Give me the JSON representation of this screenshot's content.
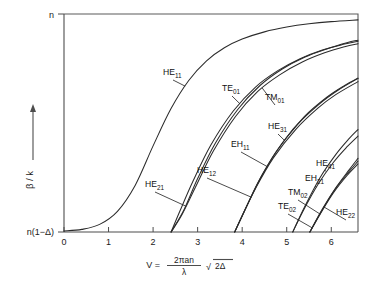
{
  "chart_data": {
    "type": "line",
    "title": "",
    "xlabel": "V = 2πan/λ √(2Δ)",
    "ylabel": "β / k",
    "xlim": [
      0,
      6.6
    ],
    "ylim": [
      0,
      1
    ],
    "grid": false,
    "legend_position": "inline-annotations",
    "x_ticks": [
      "0",
      "1",
      "2",
      "3",
      "4",
      "5",
      "6"
    ],
    "x_tick_values": [
      0,
      1,
      2,
      3,
      4,
      5,
      6
    ],
    "y_tick_labels": [
      "n",
      "n(1-Δ)"
    ],
    "y_tick_values": [
      1,
      0
    ],
    "series": [
      {
        "name": "HE11",
        "label_base": "HE",
        "label_sub": "11",
        "cutoff_v": 0.0,
        "points": [
          [
            0,
            0.005
          ],
          [
            0.4,
            0.012
          ],
          [
            0.8,
            0.035
          ],
          [
            1.2,
            0.095
          ],
          [
            1.6,
            0.215
          ],
          [
            2.0,
            0.395
          ],
          [
            2.4,
            0.565
          ],
          [
            2.8,
            0.695
          ],
          [
            3.2,
            0.785
          ],
          [
            3.6,
            0.845
          ],
          [
            4.0,
            0.885
          ],
          [
            4.5,
            0.918
          ],
          [
            5.0,
            0.94
          ],
          [
            5.5,
            0.955
          ],
          [
            6.0,
            0.965
          ],
          [
            6.6,
            0.973
          ]
        ]
      },
      {
        "name": "TE01",
        "label_base": "TE",
        "label_sub": "01",
        "cutoff_v": 2.405,
        "points": [
          [
            2.405,
            0.0
          ],
          [
            2.6,
            0.095
          ],
          [
            2.9,
            0.235
          ],
          [
            3.3,
            0.4
          ],
          [
            3.8,
            0.555
          ],
          [
            4.3,
            0.665
          ],
          [
            4.8,
            0.74
          ],
          [
            5.3,
            0.795
          ],
          [
            5.8,
            0.835
          ],
          [
            6.3,
            0.862
          ],
          [
            6.6,
            0.875
          ]
        ]
      },
      {
        "name": "TM01",
        "label_base": "TM",
        "label_sub": "01",
        "cutoff_v": 2.405,
        "points": [
          [
            2.405,
            0.0
          ],
          [
            2.65,
            0.08
          ],
          [
            2.95,
            0.205
          ],
          [
            3.35,
            0.37
          ],
          [
            3.85,
            0.53
          ],
          [
            4.35,
            0.645
          ],
          [
            4.85,
            0.722
          ],
          [
            5.35,
            0.78
          ],
          [
            5.85,
            0.822
          ],
          [
            6.3,
            0.85
          ],
          [
            6.6,
            0.864
          ]
        ]
      },
      {
        "name": "HE21",
        "label_base": "HE",
        "label_sub": "21",
        "cutoff_v": 2.405,
        "points": [
          [
            2.405,
            0.0
          ],
          [
            2.7,
            0.105
          ],
          [
            3.0,
            0.245
          ],
          [
            3.4,
            0.408
          ],
          [
            3.9,
            0.562
          ],
          [
            4.4,
            0.672
          ],
          [
            4.9,
            0.748
          ],
          [
            5.4,
            0.802
          ],
          [
            5.9,
            0.84
          ],
          [
            6.35,
            0.868
          ],
          [
            6.6,
            0.88
          ]
        ]
      },
      {
        "name": "EH11",
        "label_base": "EH",
        "label_sub": "11",
        "cutoff_v": 3.832,
        "points": [
          [
            3.832,
            0.0
          ],
          [
            4.0,
            0.075
          ],
          [
            4.3,
            0.2
          ],
          [
            4.7,
            0.34
          ],
          [
            5.2,
            0.47
          ],
          [
            5.7,
            0.568
          ],
          [
            6.1,
            0.63
          ],
          [
            6.6,
            0.69
          ]
        ]
      },
      {
        "name": "HE12",
        "label_base": "HE",
        "label_sub": "12",
        "cutoff_v": 3.832,
        "points": [
          [
            3.832,
            0.0
          ],
          [
            4.05,
            0.095
          ],
          [
            4.35,
            0.225
          ],
          [
            4.75,
            0.365
          ],
          [
            5.25,
            0.495
          ],
          [
            5.75,
            0.59
          ],
          [
            6.15,
            0.65
          ],
          [
            6.6,
            0.705
          ]
        ]
      },
      {
        "name": "HE31",
        "label_base": "HE",
        "label_sub": "31",
        "cutoff_v": 3.832,
        "points": [
          [
            3.832,
            0.0
          ],
          [
            4.1,
            0.118
          ],
          [
            4.45,
            0.262
          ],
          [
            4.9,
            0.408
          ],
          [
            5.4,
            0.53
          ],
          [
            5.9,
            0.618
          ],
          [
            6.3,
            0.672
          ],
          [
            6.6,
            0.705
          ]
        ]
      },
      {
        "name": "EH21",
        "label_base": "EH",
        "label_sub": "21",
        "cutoff_v": 5.136,
        "points": [
          [
            5.136,
            0.0
          ],
          [
            5.35,
            0.09
          ],
          [
            5.7,
            0.218
          ],
          [
            6.05,
            0.32
          ],
          [
            6.35,
            0.39
          ],
          [
            6.6,
            0.44
          ]
        ]
      },
      {
        "name": "HE41",
        "label_base": "HE",
        "label_sub": "41",
        "cutoff_v": 5.136,
        "points": [
          [
            5.136,
            0.0
          ],
          [
            5.4,
            0.115
          ],
          [
            5.75,
            0.25
          ],
          [
            6.1,
            0.355
          ],
          [
            6.4,
            0.428
          ],
          [
            6.6,
            0.47
          ]
        ]
      },
      {
        "name": "TM02",
        "label_base": "TM",
        "label_sub": "02",
        "cutoff_v": 5.52,
        "points": [
          [
            5.52,
            0.0
          ],
          [
            5.75,
            0.082
          ],
          [
            6.05,
            0.18
          ],
          [
            6.35,
            0.258
          ],
          [
            6.6,
            0.312
          ]
        ]
      },
      {
        "name": "TE02",
        "label_base": "TE",
        "label_sub": "02",
        "cutoff_v": 5.52,
        "points": [
          [
            5.52,
            0.0
          ],
          [
            5.78,
            0.095
          ],
          [
            6.08,
            0.195
          ],
          [
            6.38,
            0.272
          ],
          [
            6.6,
            0.325
          ]
        ]
      },
      {
        "name": "HE22",
        "label_base": "HE",
        "label_sub": "22",
        "cutoff_v": 5.52,
        "points": [
          [
            5.52,
            0.0
          ],
          [
            5.8,
            0.105
          ],
          [
            6.12,
            0.208
          ],
          [
            6.4,
            0.285
          ],
          [
            6.6,
            0.338
          ]
        ]
      }
    ],
    "annotations": [
      {
        "name": "HE11",
        "base": "HE",
        "sub": "11",
        "text_x": 163,
        "text_y": 75
      },
      {
        "name": "TE01",
        "base": "TE",
        "sub": "01",
        "text_x": 222,
        "text_y": 91
      },
      {
        "name": "TM01",
        "base": "TM",
        "sub": "01",
        "text_x": 265,
        "text_y": 100
      },
      {
        "name": "HE31",
        "base": "HE",
        "sub": "31",
        "text_x": 268,
        "text_y": 129
      },
      {
        "name": "EH11",
        "base": "EH",
        "sub": "11",
        "text_x": 231,
        "text_y": 147
      },
      {
        "name": "HE12",
        "base": "HE",
        "sub": "12",
        "text_x": 197,
        "text_y": 173
      },
      {
        "name": "HE21",
        "base": "HE",
        "sub": "21",
        "text_x": 145,
        "text_y": 187
      },
      {
        "name": "HE41",
        "base": "HE",
        "sub": "41",
        "text_x": 316,
        "text_y": 166
      },
      {
        "name": "EH21",
        "base": "EH",
        "sub": "21",
        "text_x": 305,
        "text_y": 181
      },
      {
        "name": "TM02",
        "base": "TM",
        "sub": "02",
        "text_x": 288,
        "text_y": 195
      },
      {
        "name": "TE02",
        "base": "TE",
        "sub": "02",
        "text_x": 278,
        "text_y": 209
      },
      {
        "name": "HE22",
        "base": "HE",
        "sub": "22",
        "text_x": 336,
        "text_y": 215
      }
    ]
  },
  "axes": {
    "y_top_label": "n",
    "y_bottom_label": "n(1−Δ)",
    "y_axis_title": "β / k",
    "x_ticks": [
      "0",
      "1",
      "2",
      "3",
      "4",
      "5",
      "6"
    ],
    "x_formula_lhs": "V =",
    "x_formula_numerator": "2πan",
    "x_formula_denominator": "λ",
    "x_formula_radicand": "2Δ",
    "x_formula_radical": "√"
  },
  "colors": {
    "curve": "#2b2b2b",
    "axis": "#4d4d4d",
    "background": "#ffffff",
    "text": "#1a1a1a"
  }
}
